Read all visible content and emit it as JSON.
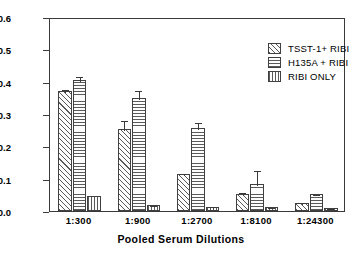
{
  "chart_data": {
    "type": "bar",
    "title": "",
    "xlabel": "Pooled  Serum  Dilutions",
    "ylabel": "Absorbance  (405  nm)",
    "ylim": [
      0.0,
      0.6
    ],
    "yticks": [
      "0.0",
      "0.1",
      "0.2",
      "0.3",
      "0.4",
      "0.5",
      "0.6"
    ],
    "grid": false,
    "legend_position": "top-right",
    "categories": [
      "1:300",
      "1:900",
      "1:2700",
      "1:8100",
      "1:24300"
    ],
    "series": [
      {
        "name": "TSST-1+ RIBI",
        "pattern": "diagonal",
        "values": [
          0.37,
          0.254,
          0.115,
          0.052,
          0.025
        ],
        "errors": [
          0.011,
          0.031,
          0.005,
          0.009,
          0.006
        ]
      },
      {
        "name": "H135A + RIBI",
        "pattern": "horizontal",
        "values": [
          0.405,
          0.348,
          0.257,
          0.083,
          0.053
        ],
        "errors": [
          0.017,
          0.029,
          0.02,
          0.048,
          0.003
        ]
      },
      {
        "name": "RIBI ONLY",
        "pattern": "vertical",
        "values": [
          0.045,
          0.019,
          0.013,
          0.011,
          0.009
        ],
        "errors": [
          0.0,
          0.003,
          0.006,
          0.003,
          0.002
        ]
      }
    ]
  },
  "legend": {
    "items": [
      {
        "label": "TSST-1+ RIBI",
        "pattern": "diagonal"
      },
      {
        "label": "H135A + RIBI",
        "pattern": "horizontal"
      },
      {
        "label": "RIBI ONLY",
        "pattern": "vertical"
      }
    ]
  },
  "colors": {
    "axis": "#3a3a3a",
    "bar_outline": "#404040",
    "hatch": "#5a5a5a",
    "background": "#ffffff"
  }
}
